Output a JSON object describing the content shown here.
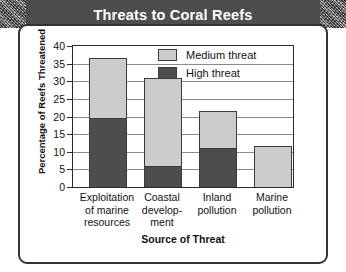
{
  "chart_data": {
    "type": "bar",
    "subtype": "stacked-bar",
    "title": "Threats to Coral Reefs",
    "xlabel": "Source of Threat",
    "ylabel": "Percentage of Reefs Threatened",
    "ylim": [
      0,
      40
    ],
    "ytick_labels": [
      "40",
      "35",
      "30",
      "25",
      "20",
      "15",
      "10",
      "5",
      "0"
    ],
    "yticks": [
      40,
      35,
      30,
      25,
      20,
      15,
      10,
      5,
      0
    ],
    "grid": true,
    "legend_position": "upper-right-inside",
    "categories": [
      "Exploitation of marine resources",
      "Coastal develop- ment",
      "Inland pollution",
      "Marine pollution"
    ],
    "category_lines": [
      [
        "Exploitation",
        "of marine",
        "resources"
      ],
      [
        "Coastal",
        "develop-",
        "ment"
      ],
      [
        "Inland",
        "pollution"
      ],
      [
        "Marine",
        "pollution"
      ]
    ],
    "series": [
      {
        "name": "High threat",
        "color": "#4d4d4d",
        "values": [
          19.5,
          6,
          11,
          0
        ]
      },
      {
        "name": "Medium threat",
        "color": "#cccccc",
        "values": [
          17,
          25,
          10.5,
          11.5
        ]
      }
    ],
    "totals": [
      36.5,
      31,
      21.5,
      11.5
    ],
    "legend": [
      {
        "label": "Medium threat",
        "swatch": "medium"
      },
      {
        "label": "High threat",
        "swatch": "high"
      }
    ]
  },
  "colors": {
    "title_bar": "#4d4d4d",
    "title_text": "#ffffff",
    "frame_border": "#333333",
    "high_threat": "#4d4d4d",
    "medium_threat": "#cccccc",
    "gridline": "#8a8a8a",
    "background": "#ffffff"
  }
}
